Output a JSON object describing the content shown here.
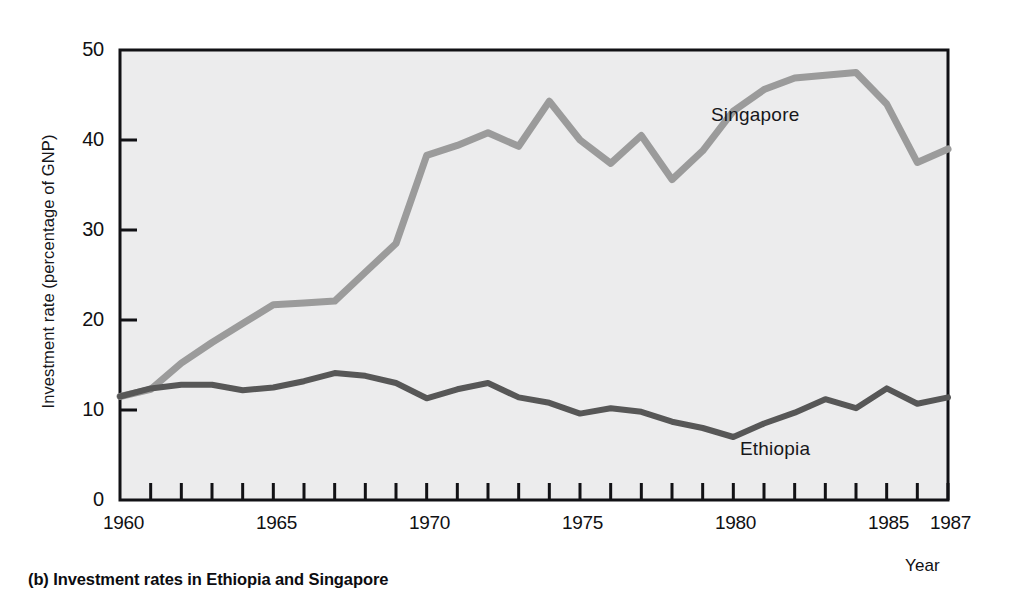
{
  "caption": "(b) Investment rates in Ethiopia and Singapore",
  "axis": {
    "ylabel": "Investment rate (percentage of GNP)",
    "xlabel": "Year",
    "yticks": [
      "0",
      "10",
      "20",
      "30",
      "40",
      "50"
    ],
    "xticks": [
      "1960",
      "1965",
      "1970",
      "1975",
      "1980",
      "1985",
      "1987"
    ]
  },
  "labels": {
    "singapore": "Singapore",
    "ethiopia": "Ethiopia"
  },
  "colors": {
    "plot_background": "#ececed",
    "axis": "#111115",
    "singapore_line": "#9b9b9b",
    "ethiopia_line": "#575757",
    "page_background": "#ffffff"
  },
  "chart_data": {
    "type": "line",
    "title": "(b) Investment rates in Ethiopia and Singapore",
    "xlabel": "Year",
    "ylabel": "Investment rate (percentage of GNP)",
    "xlim": [
      1960,
      1987
    ],
    "ylim": [
      0,
      50
    ],
    "grid": false,
    "legend": "inline-labels",
    "x": [
      1960,
      1961,
      1962,
      1963,
      1964,
      1965,
      1966,
      1967,
      1968,
      1969,
      1970,
      1971,
      1972,
      1973,
      1974,
      1975,
      1976,
      1977,
      1978,
      1979,
      1980,
      1981,
      1982,
      1983,
      1984,
      1985,
      1986,
      1987
    ],
    "series": [
      {
        "name": "Singapore",
        "color": "#9b9b9b",
        "values": [
          11.5,
          12.3,
          15.2,
          17.5,
          19.6,
          21.7,
          21.9,
          22.1,
          25.3,
          28.5,
          38.3,
          39.4,
          40.8,
          39.3,
          44.3,
          40.0,
          37.4,
          40.5,
          35.6,
          38.8,
          43.2,
          45.6,
          46.9,
          47.2,
          47.5,
          44.0,
          37.5,
          39.0
        ]
      },
      {
        "name": "Ethiopia",
        "color": "#575757",
        "values": [
          11.5,
          12.4,
          12.8,
          12.8,
          12.2,
          12.5,
          13.2,
          14.1,
          13.8,
          13.0,
          11.3,
          12.3,
          13.0,
          11.4,
          10.8,
          9.6,
          10.2,
          9.8,
          8.7,
          8.0,
          7.0,
          8.5,
          9.7,
          11.2,
          10.2,
          12.4,
          10.7,
          11.4
        ]
      }
    ]
  }
}
